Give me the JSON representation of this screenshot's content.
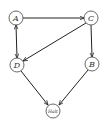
{
  "diagram": {
    "type": "directed-graph",
    "nodes": [
      {
        "id": "A",
        "label": "A",
        "x": 16,
        "y": 18
      },
      {
        "id": "C",
        "label": "C",
        "x": 91,
        "y": 18
      },
      {
        "id": "D",
        "label": "D",
        "x": 17,
        "y": 65
      },
      {
        "id": "B",
        "label": "B",
        "x": 92,
        "y": 64
      },
      {
        "id": "Halt",
        "label": "Halt",
        "x": 53,
        "y": 111
      }
    ],
    "edges": [
      {
        "from": "A",
        "to": "C",
        "bidirectional": false
      },
      {
        "from": "A",
        "to": "D",
        "bidirectional": true
      },
      {
        "from": "C",
        "to": "D",
        "bidirectional": false
      },
      {
        "from": "C",
        "to": "B",
        "bidirectional": false
      },
      {
        "from": "D",
        "to": "Halt",
        "bidirectional": false
      },
      {
        "from": "B",
        "to": "Halt",
        "bidirectional": false
      }
    ],
    "colors": {
      "stroke": "#222222",
      "node_fill": "#ffffff"
    }
  }
}
